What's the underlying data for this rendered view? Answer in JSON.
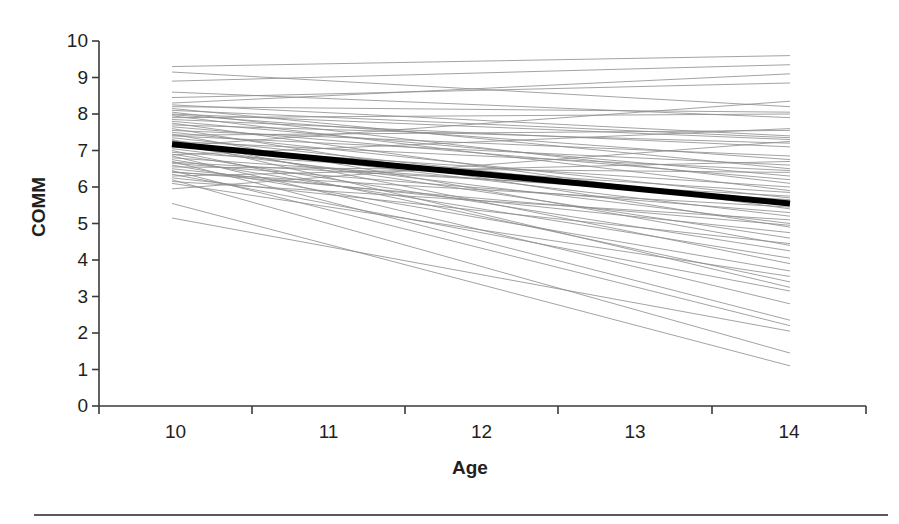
{
  "figure": {
    "background_color": "#ffffff",
    "width": 899,
    "height": 524,
    "footer_rule_color": "#5a5a5a"
  },
  "axes": {
    "y_title": "COMM",
    "x_title": "Age",
    "axis_color": "#3a3a3a",
    "label_color": "#231f20"
  },
  "chart_data": {
    "type": "line",
    "title": "",
    "xlabel": "Age",
    "ylabel": "COMM",
    "xlim": [
      10,
      14
    ],
    "ylim": [
      0,
      10
    ],
    "xticks": [
      10,
      11,
      12,
      13,
      14
    ],
    "yticks": [
      0,
      1,
      2,
      3,
      4,
      5,
      6,
      7,
      8,
      9,
      10
    ],
    "xtick_labels": [
      "10",
      "11",
      "12",
      "13",
      "14"
    ],
    "ytick_labels": [
      "0",
      "1",
      "2",
      "3",
      "4",
      "5",
      "6",
      "7",
      "8",
      "9",
      "10"
    ],
    "grid": false,
    "legend": null,
    "x": [
      10,
      14
    ],
    "mean_series": {
      "name": "mean trajectory",
      "color": "#000000",
      "line_width": 6,
      "values": [
        7.17,
        5.55
      ]
    },
    "individual_series_color": "#8c8c8c",
    "individual_series_line_width": 0.8,
    "individual_series": [
      {
        "name": "s1",
        "values": [
          9.3,
          9.6
        ]
      },
      {
        "name": "s2",
        "values": [
          8.9,
          9.35
        ]
      },
      {
        "name": "s3",
        "values": [
          8.45,
          8.85
        ]
      },
      {
        "name": "s4",
        "values": [
          8.3,
          9.1
        ]
      },
      {
        "name": "s5",
        "values": [
          8.25,
          7.4
        ]
      },
      {
        "name": "s6",
        "values": [
          8.2,
          8.05
        ]
      },
      {
        "name": "s7",
        "values": [
          8.15,
          6.5
        ]
      },
      {
        "name": "s8",
        "values": [
          8.1,
          7.35
        ]
      },
      {
        "name": "s9",
        "values": [
          8.05,
          6.1
        ]
      },
      {
        "name": "s10",
        "values": [
          8.0,
          7.3
        ]
      },
      {
        "name": "s11",
        "values": [
          7.95,
          5.9
        ]
      },
      {
        "name": "s12",
        "values": [
          7.9,
          8.0
        ]
      },
      {
        "name": "s13",
        "values": [
          7.85,
          7.1
        ]
      },
      {
        "name": "s14",
        "values": [
          7.8,
          6.3
        ]
      },
      {
        "name": "s15",
        "values": [
          7.75,
          5.4
        ]
      },
      {
        "name": "s16",
        "values": [
          7.7,
          7.2
        ]
      },
      {
        "name": "s17",
        "values": [
          7.65,
          6.2
        ]
      },
      {
        "name": "s18",
        "values": [
          7.6,
          4.9
        ]
      },
      {
        "name": "s19",
        "values": [
          7.55,
          6.85
        ]
      },
      {
        "name": "s20",
        "values": [
          7.5,
          5.7
        ]
      },
      {
        "name": "s21",
        "values": [
          7.45,
          4.4
        ]
      },
      {
        "name": "s22",
        "values": [
          7.4,
          6.6
        ]
      },
      {
        "name": "s23",
        "values": [
          7.35,
          5.55
        ]
      },
      {
        "name": "s24",
        "values": [
          7.3,
          3.9
        ]
      },
      {
        "name": "s25",
        "values": [
          7.25,
          6.45
        ]
      },
      {
        "name": "s26",
        "values": [
          7.2,
          5.2
        ]
      },
      {
        "name": "s27",
        "values": [
          7.15,
          4.6
        ]
      },
      {
        "name": "s28",
        "values": [
          7.1,
          6.0
        ]
      },
      {
        "name": "s29",
        "values": [
          7.05,
          5.0
        ]
      },
      {
        "name": "s30",
        "values": [
          7.0,
          3.4
        ]
      },
      {
        "name": "s31",
        "values": [
          6.95,
          5.85
        ]
      },
      {
        "name": "s32",
        "values": [
          6.9,
          4.25
        ]
      },
      {
        "name": "s33",
        "values": [
          6.85,
          2.8
        ]
      },
      {
        "name": "s34",
        "values": [
          6.8,
          5.65
        ]
      },
      {
        "name": "s35",
        "values": [
          6.75,
          4.05
        ]
      },
      {
        "name": "s36",
        "values": [
          6.7,
          2.35
        ]
      },
      {
        "name": "s37",
        "values": [
          6.65,
          5.3
        ]
      },
      {
        "name": "s38",
        "values": [
          6.6,
          3.7
        ]
      },
      {
        "name": "s39",
        "values": [
          6.55,
          6.4
        ]
      },
      {
        "name": "s40",
        "values": [
          6.5,
          4.75
        ]
      },
      {
        "name": "s41",
        "values": [
          6.45,
          2.2
        ]
      },
      {
        "name": "s42",
        "values": [
          6.4,
          5.45
        ]
      },
      {
        "name": "s43",
        "values": [
          6.35,
          3.15
        ]
      },
      {
        "name": "s44",
        "values": [
          6.3,
          6.7
        ]
      },
      {
        "name": "s45",
        "values": [
          6.25,
          4.45
        ]
      },
      {
        "name": "s46",
        "values": [
          6.2,
          1.45
        ]
      },
      {
        "name": "s47",
        "values": [
          6.15,
          5.1
        ]
      },
      {
        "name": "s48",
        "values": [
          6.1,
          3.55
        ]
      },
      {
        "name": "s49",
        "values": [
          5.95,
          7.25
        ]
      },
      {
        "name": "s50",
        "values": [
          5.55,
          1.1
        ]
      },
      {
        "name": "s51",
        "values": [
          5.15,
          2.05
        ]
      },
      {
        "name": "s52",
        "values": [
          8.6,
          7.9
        ]
      },
      {
        "name": "s53",
        "values": [
          9.15,
          8.2
        ]
      },
      {
        "name": "s54",
        "values": [
          7.98,
          6.75
        ]
      },
      {
        "name": "s55",
        "values": [
          7.42,
          7.55
        ]
      },
      {
        "name": "s56",
        "values": [
          6.88,
          7.6
        ]
      },
      {
        "name": "s57",
        "values": [
          7.12,
          8.35
        ]
      },
      {
        "name": "s58",
        "values": [
          6.42,
          4.95
        ]
      },
      {
        "name": "s59",
        "values": [
          7.28,
          3.25
        ]
      },
      {
        "name": "s60",
        "values": [
          6.68,
          5.75
        ]
      }
    ]
  }
}
